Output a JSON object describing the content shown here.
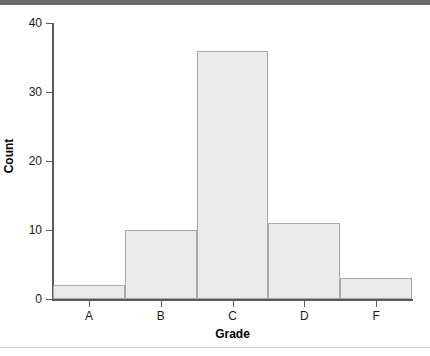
{
  "chart_data": {
    "type": "bar",
    "title": "",
    "categories": [
      "A",
      "B",
      "C",
      "D",
      "F"
    ],
    "values": [
      2,
      10,
      36,
      11,
      3
    ],
    "xlabel": "Grade",
    "ylabel": "Count",
    "ylim": [
      0,
      40
    ],
    "yticks": [
      0,
      10,
      20,
      30,
      40
    ],
    "ytick_labels": [
      "0",
      "10",
      "20",
      "30",
      "40"
    ],
    "grid": false,
    "legend": null,
    "bar_fill_color": "#ebebeb",
    "bar_border_color": "#a8a8a8",
    "axis_color": "#5a5a5a",
    "text_color": "#1a1a1a"
  },
  "decor": {
    "top_rule_color": "#6b6b6b",
    "bottom_rule_color": "#c9c9c9"
  }
}
